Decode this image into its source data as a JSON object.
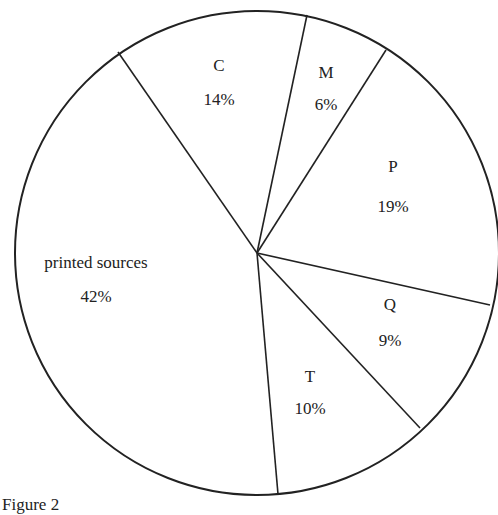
{
  "caption": "Figure 2",
  "chart_data": {
    "type": "pie",
    "title": "",
    "caption": "Figure 2",
    "categories": [
      "C",
      "M",
      "P",
      "Q",
      "T",
      "printed sources"
    ],
    "values": [
      14,
      6,
      19,
      9,
      10,
      42
    ],
    "unit": "%",
    "labels": [
      "14%",
      "6%",
      "19%",
      "9%",
      "10%",
      "42%"
    ],
    "legend": "none (labels inside slices)",
    "style": {
      "fill": "#ffffff",
      "stroke": "#222222",
      "text": "#222222"
    },
    "geometry": {
      "center": [
        257,
        253
      ],
      "radius": 242,
      "boundary_points": [
        [
          118,
          52
        ],
        [
          307,
          15
        ],
        [
          386,
          50
        ],
        [
          490,
          305
        ],
        [
          420,
          428
        ],
        [
          278,
          494
        ]
      ]
    },
    "slices": [
      {
        "name": "C",
        "value": "14%",
        "label_pos": [
          219,
          71
        ],
        "value_pos": [
          219,
          105
        ]
      },
      {
        "name": "M",
        "value": "6%",
        "label_pos": [
          326,
          78
        ],
        "value_pos": [
          326,
          110
        ]
      },
      {
        "name": "P",
        "value": "19%",
        "label_pos": [
          393,
          172
        ],
        "value_pos": [
          393,
          212
        ]
      },
      {
        "name": "Q",
        "value": "9%",
        "label_pos": [
          390,
          310
        ],
        "value_pos": [
          390,
          346
        ]
      },
      {
        "name": "T",
        "value": "10%",
        "label_pos": [
          310,
          382
        ],
        "value_pos": [
          310,
          414
        ]
      },
      {
        "name": "printed sources",
        "value": "42%",
        "label_pos": [
          96,
          268
        ],
        "value_pos": [
          96,
          302
        ]
      }
    ]
  }
}
